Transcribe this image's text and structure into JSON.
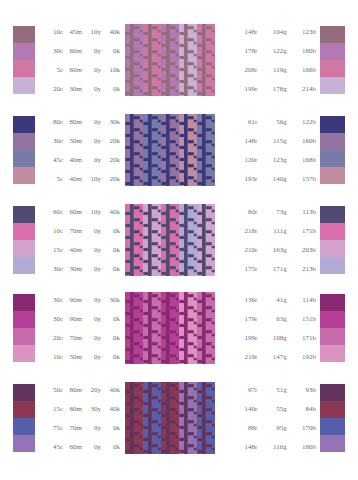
{
  "page": {
    "background": "#ffffff",
    "text_color": "#70706f",
    "rows_count": 5
  },
  "columns": {
    "cmyk_headers": [
      "c",
      "m",
      "y",
      "k"
    ],
    "rgb_headers": [
      "r",
      "g",
      "b"
    ]
  },
  "rows": [
    {
      "index": 1,
      "cmyk": [
        [
          "10c",
          "45m",
          "10y",
          "40k"
        ],
        [
          "30c",
          "60m",
          "0y",
          "0k"
        ],
        [
          "5c",
          "60m",
          "0y",
          "10k"
        ],
        [
          "20c",
          "30m",
          "0y",
          "0k"
        ]
      ],
      "rgb": [
        [
          "148r",
          "104g",
          "123b"
        ],
        [
          "178r",
          "122g",
          "180b"
        ],
        [
          "208r",
          "119g",
          "166b"
        ],
        [
          "199r",
          "178g",
          "214b"
        ]
      ],
      "colors": [
        "#946c7b",
        "#b27ab4",
        "#d077a6",
        "#c7b2d6"
      ],
      "pattern_colors": [
        "#946c7b",
        "#b27ab4",
        "#d077a6",
        "#c7b2d6"
      ]
    },
    {
      "index": 2,
      "cmyk": [
        [
          "80c",
          "80m",
          "0y",
          "30k"
        ],
        [
          "30c",
          "50m",
          "0y",
          "20k"
        ],
        [
          "45c",
          "40m",
          "0y",
          "20k"
        ],
        [
          "5c",
          "40m",
          "10y",
          "20k"
        ]
      ],
      "rgb": [
        [
          "61r",
          "56g",
          "122b"
        ],
        [
          "148r",
          "115g",
          "160b"
        ],
        [
          "120r",
          "123g",
          "168b"
        ],
        [
          "193r",
          "140g",
          "157b"
        ]
      ],
      "colors": [
        "#3d387a",
        "#9473a0",
        "#787ba8",
        "#c18c9d"
      ],
      "pattern_colors": [
        "#3d387a",
        "#9473a0",
        "#787ba8",
        "#c18c9d"
      ]
    },
    {
      "index": 3,
      "cmyk": [
        [
          "60c",
          "60m",
          "10y",
          "40k"
        ],
        [
          "10c",
          "70m",
          "0y",
          "0k"
        ],
        [
          "15c",
          "40m",
          "0y",
          "0k"
        ],
        [
          "30c",
          "30m",
          "0y",
          "0k"
        ]
      ],
      "rgb": [
        [
          "80r",
          "73g",
          "113b"
        ],
        [
          "218r",
          "111g",
          "171b"
        ],
        [
          "210r",
          "163g",
          "203b"
        ],
        [
          "175r",
          "171g",
          "213b"
        ]
      ],
      "colors": [
        "#504971",
        "#da6fab",
        "#d2a3cb",
        "#afabd5"
      ],
      "pattern_colors": [
        "#504971",
        "#da6fab",
        "#d2a3cb",
        "#afabd5"
      ]
    },
    {
      "index": 4,
      "cmyk": [
        [
          "30c",
          "90m",
          "0y",
          "30k"
        ],
        [
          "30c",
          "90m",
          "0y",
          "0k"
        ],
        [
          "20c",
          "70m",
          "0y",
          "0k"
        ],
        [
          "10c",
          "50m",
          "0y",
          "0k"
        ]
      ],
      "rgb": [
        [
          "136r",
          "41g",
          "114b"
        ],
        [
          "179r",
          "63g",
          "151b"
        ],
        [
          "199r",
          "108g",
          "171b"
        ],
        [
          "219r",
          "147g",
          "192b"
        ]
      ],
      "colors": [
        "#882972",
        "#b33f97",
        "#c76cab",
        "#db93c0"
      ],
      "pattern_colors": [
        "#882972",
        "#b33f97",
        "#c76cab",
        "#db93c0"
      ]
    },
    {
      "index": 5,
      "cmyk": [
        [
          "50c",
          "80m",
          "20y",
          "40k"
        ],
        [
          "15c",
          "80m",
          "30y",
          "40k"
        ],
        [
          "75c",
          "70m",
          "0y",
          "0k"
        ],
        [
          "45c",
          "60m",
          "0y",
          "0k"
        ]
      ],
      "rgb": [
        [
          "97r",
          "51g",
          "93b"
        ],
        [
          "140r",
          "55g",
          "84b"
        ],
        [
          "88r",
          "95g",
          "170b"
        ],
        [
          "148r",
          "116g",
          "180b"
        ]
      ],
      "colors": [
        "#61335d",
        "#8c3754",
        "#585faa",
        "#9474b4"
      ],
      "pattern_colors": [
        "#61335d",
        "#8c3754",
        "#585faa",
        "#9474b4"
      ]
    }
  ]
}
